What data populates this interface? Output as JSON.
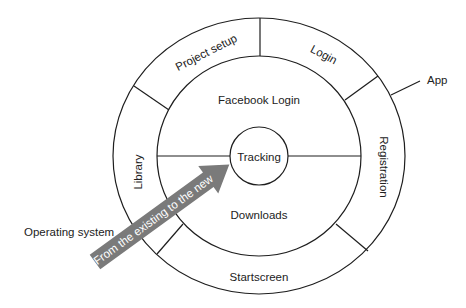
{
  "diagram": {
    "type": "concentric-rings",
    "colors": {
      "stroke": "#1e1e1e",
      "text": "#222222",
      "arrow": "#7a7a7a",
      "arrow_text": "#ffffff",
      "background": "#ffffff"
    },
    "center": {
      "label": "Tracking"
    },
    "middle_ring": {
      "top_label": "Facebook Login",
      "bottom_label": "Downloads"
    },
    "outer_ring": {
      "segments": [
        {
          "label": "Project setup"
        },
        {
          "label": "Login"
        },
        {
          "label": "Registration"
        },
        {
          "label": "Startscreen"
        },
        {
          "label": "Library"
        }
      ]
    },
    "external_labels": {
      "app": "App",
      "operating_system": "Operating system"
    },
    "arrow": {
      "label": "From the existing to the new"
    }
  }
}
